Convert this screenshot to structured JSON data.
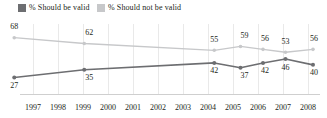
{
  "legend": {
    "items": [
      {
        "label": "% Should be valid",
        "color": "#6d6e71",
        "swatch": "legend-swatch-valid"
      },
      {
        "label": "% Should not be valid",
        "color": "#c7c8ca",
        "swatch": "legend-swatch-not-valid"
      }
    ]
  },
  "chart_data": {
    "type": "line",
    "title": "",
    "subtitle": "",
    "xlabel": "",
    "ylabel": "",
    "grid": true,
    "legend_position": "top-left",
    "x_tick_labels": [
      "1997",
      "1998",
      "1999",
      "2000",
      "2001",
      "2002",
      "2003",
      "2004",
      "2005",
      "2006",
      "2007",
      "2008"
    ],
    "x_points": [
      1996.25,
      1999.05,
      2004.25,
      2005.3,
      2006.2,
      2007.1,
      2008.2
    ],
    "point_label_dx": [
      0,
      5,
      0,
      4,
      2,
      0,
      1
    ],
    "series": [
      {
        "name": "% Should be valid",
        "color": "#6d6e71",
        "values": [
          27,
          35,
          42,
          37,
          42,
          46,
          40
        ],
        "label_position": "below",
        "line_width": 1.6,
        "marker_radius": 2.0
      },
      {
        "name": "% Should not be valid",
        "color": "#c7c8ca",
        "values": [
          68,
          62,
          55,
          59,
          56,
          53,
          56
        ],
        "label_position": "above",
        "line_width": 1.3,
        "marker_radius": 1.8
      }
    ]
  }
}
